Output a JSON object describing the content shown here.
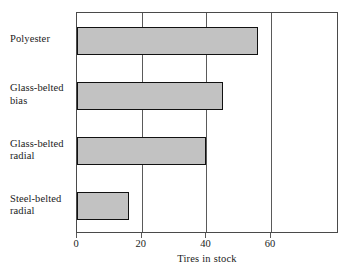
{
  "chart_data": {
    "type": "bar",
    "orientation": "horizontal",
    "title": "",
    "xlabel": "Tires in stock",
    "ylabel": "",
    "categories": [
      "Polyester",
      "Glass-belted bias",
      "Glass-belted radial",
      "Steel-belted radial"
    ],
    "category_lines": [
      [
        "Polyester"
      ],
      [
        "Glass-belted",
        "bias"
      ],
      [
        "Glass-belted",
        "radial"
      ],
      [
        "Steel-belted",
        "radial"
      ]
    ],
    "values": [
      56,
      45,
      40,
      16
    ],
    "xlim": [
      0,
      81
    ],
    "xticks": [
      0,
      20,
      40,
      60
    ],
    "xtick_labels": [
      "0",
      "20",
      "40",
      "60"
    ],
    "grid": "vertical",
    "legend": "none",
    "bar_fill": "#c2c2c2",
    "bar_edge": "#111111",
    "frame_color": "#4a4a4a"
  }
}
